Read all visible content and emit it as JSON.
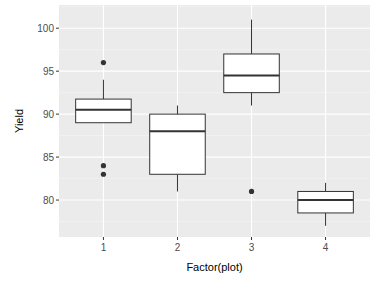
{
  "chart_data": {
    "type": "box",
    "title": "",
    "xlabel": "Factor(plot)",
    "ylabel": "Yield",
    "categories": [
      "1",
      "2",
      "3",
      "4"
    ],
    "ylim": [
      75.7,
      102.7
    ],
    "yticks": [
      80,
      85,
      90,
      95,
      100
    ],
    "grid": true,
    "legend": "none",
    "boxes": [
      {
        "category": "1",
        "whisker_low": 89,
        "q1": 89,
        "median": 90.5,
        "q3": 91.75,
        "whisker_high": 94,
        "outliers": [
          96,
          84,
          83
        ]
      },
      {
        "category": "2",
        "whisker_low": 81,
        "q1": 83,
        "median": 88,
        "q3": 90,
        "whisker_high": 91,
        "outliers": []
      },
      {
        "category": "3",
        "whisker_low": 91,
        "q1": 92.5,
        "median": 94.5,
        "q3": 97,
        "whisker_high": 101,
        "outliers": [
          81
        ]
      },
      {
        "category": "4",
        "whisker_low": 77,
        "q1": 78.5,
        "median": 80,
        "q3": 81,
        "whisker_high": 82,
        "outliers": []
      }
    ],
    "colors": {
      "panel": "#ebebeb",
      "grid_major": "#ffffff",
      "box_fill": "#ffffff",
      "box_line": "#333333",
      "point": "#333333"
    }
  }
}
